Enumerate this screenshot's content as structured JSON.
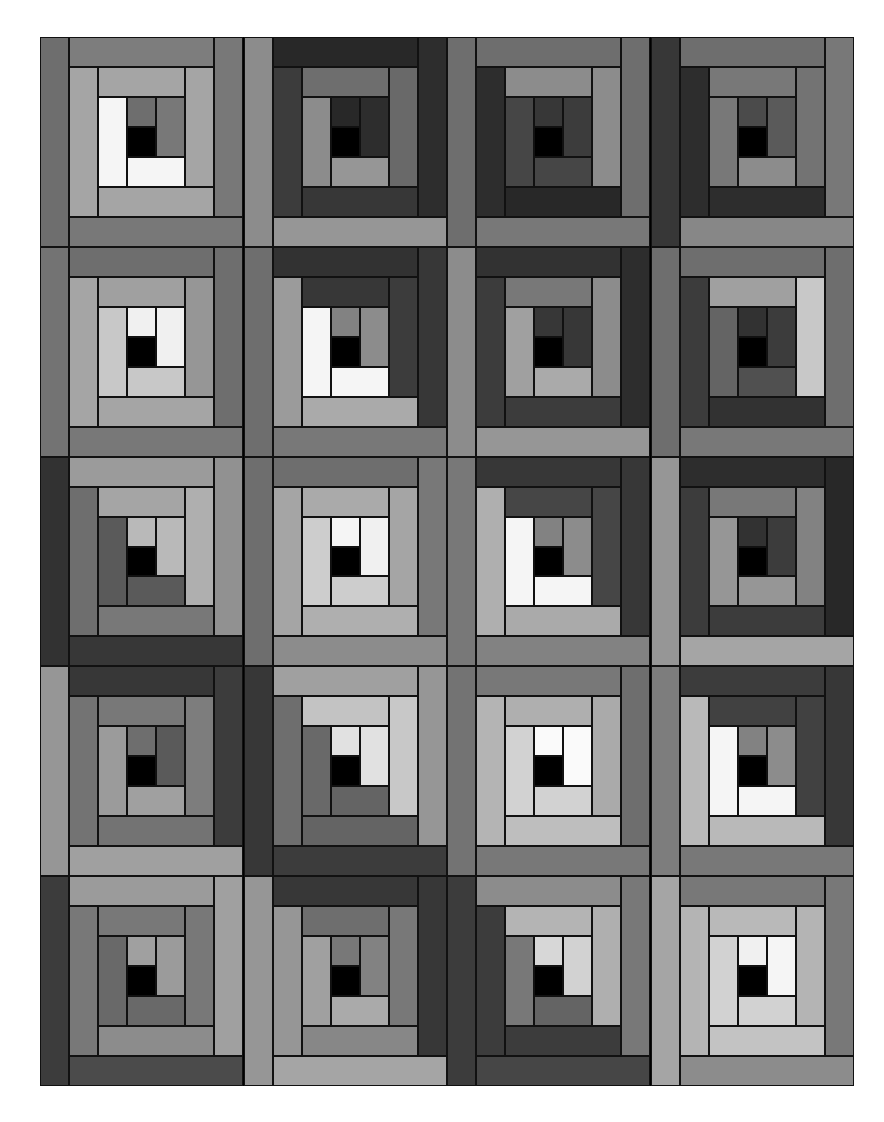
{
  "quilt": {
    "rows": 5,
    "cols": 4,
    "center_color": "#000000",
    "seam_color": "#111111",
    "log_order": [
      "top-center",
      "right-center",
      "bottom-ring1",
      "left-ring1",
      "top-ring2",
      "right-ring2",
      "bottom-ring2",
      "left-ring2",
      "top-ring3",
      "right-ring3",
      "bottom-ring3",
      "left-ring3"
    ],
    "blocks": [
      [
        110,
        120,
        245,
        245,
        165,
        165,
        165,
        165,
        125,
        120,
        120,
        110
      ],
      [
        40,
        45,
        150,
        140,
        110,
        105,
        55,
        60,
        40,
        45,
        150,
        140
      ],
      [
        55,
        60,
        70,
        70,
        140,
        140,
        40,
        45,
        110,
        110,
        120,
        110
      ],
      [
        75,
        90,
        140,
        120,
        120,
        115,
        45,
        45,
        110,
        120,
        135,
        55
      ],
      [
        240,
        240,
        200,
        200,
        160,
        150,
        165,
        165,
        110,
        110,
        120,
        115
      ],
      [
        130,
        140,
        245,
        245,
        55,
        60,
        170,
        155,
        50,
        55,
        120,
        110
      ],
      [
        55,
        55,
        170,
        160,
        120,
        140,
        60,
        60,
        50,
        45,
        150,
        140
      ],
      [
        50,
        60,
        80,
        100,
        160,
        200,
        50,
        60,
        110,
        110,
        120,
        110
      ],
      [
        185,
        185,
        90,
        90,
        165,
        175,
        120,
        110,
        155,
        145,
        55,
        50
      ],
      [
        245,
        240,
        205,
        205,
        170,
        165,
        175,
        165,
        110,
        120,
        140,
        110
      ],
      [
        130,
        140,
        245,
        245,
        70,
        70,
        170,
        175,
        55,
        55,
        130,
        120
      ],
      [
        50,
        60,
        150,
        150,
        120,
        130,
        60,
        60,
        45,
        40,
        165,
        150
      ],
      [
        110,
        90,
        160,
        155,
        120,
        125,
        115,
        115,
        55,
        60,
        160,
        150
      ],
      [
        225,
        225,
        100,
        105,
        195,
        200,
        100,
        110,
        160,
        150,
        60,
        55
      ],
      [
        250,
        250,
        210,
        210,
        175,
        170,
        190,
        180,
        120,
        110,
        120,
        115
      ],
      [
        130,
        140,
        245,
        245,
        65,
        65,
        185,
        185,
        60,
        55,
        120,
        125
      ],
      [
        160,
        155,
        105,
        105,
        120,
        120,
        140,
        120,
        155,
        160,
        75,
        60
      ],
      [
        120,
        130,
        170,
        160,
        110,
        120,
        135,
        150,
        55,
        55,
        165,
        150
      ],
      [
        215,
        210,
        100,
        120,
        180,
        175,
        60,
        60,
        140,
        120,
        70,
        60
      ],
      [
        240,
        245,
        210,
        210,
        185,
        180,
        195,
        180,
        120,
        120,
        140,
        165
      ]
    ]
  }
}
